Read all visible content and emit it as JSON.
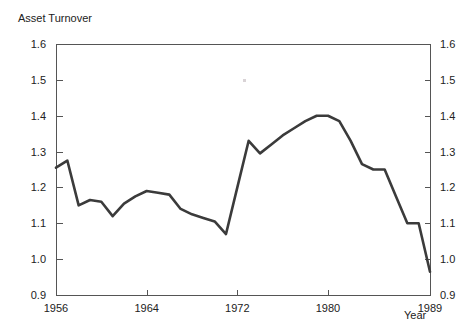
{
  "chart_data": {
    "type": "line",
    "title": "Asset Turnover",
    "xlabel": "Year",
    "ylabel": "",
    "xlim": [
      1956,
      1989
    ],
    "ylim": [
      0.9,
      1.6
    ],
    "grid": false,
    "legend": null,
    "xticks": [
      1956,
      1964,
      1972,
      1980,
      1989
    ],
    "xtick_labels": [
      "1956",
      "1964",
      "1972",
      "1980",
      "1989"
    ],
    "yticks": [
      0.9,
      1.0,
      1.1,
      1.2,
      1.3,
      1.4,
      1.5,
      1.6
    ],
    "ytick_labels": [
      "0.9",
      "1.0",
      "1.1",
      "1.2",
      "1.3",
      "1.4",
      "1.5",
      "1.6"
    ],
    "ytick_labels_right": [
      "0.9",
      "1.0",
      "1.1",
      "1.2",
      "1.3",
      "1.4",
      "1.5",
      "1.6"
    ],
    "line_color": "#3b3b3b",
    "axis_color": "#555555",
    "background_color": "#ffffff",
    "series": [
      {
        "name": "Asset Turnover",
        "x": [
          1956,
          1957,
          1958,
          1959,
          1960,
          1961,
          1962,
          1963,
          1964,
          1965,
          1966,
          1967,
          1968,
          1969,
          1970,
          1971,
          1972,
          1973,
          1974,
          1975,
          1976,
          1977,
          1978,
          1979,
          1980,
          1981,
          1982,
          1983,
          1984,
          1985,
          1986,
          1987,
          1988,
          1989
        ],
        "values": [
          1.255,
          1.275,
          1.15,
          1.165,
          1.16,
          1.12,
          1.155,
          1.175,
          1.19,
          1.185,
          1.18,
          1.14,
          1.125,
          1.115,
          1.105,
          1.07,
          1.2,
          1.33,
          1.295,
          1.32,
          1.345,
          1.365,
          1.385,
          1.4,
          1.4,
          1.385,
          1.33,
          1.265,
          1.25,
          1.25,
          1.175,
          1.1,
          1.1,
          0.965
        ]
      }
    ]
  },
  "axes": {
    "left_axis_name": "y-axis-left",
    "right_axis_name": "y-axis-right",
    "bottom_axis_name": "x-axis"
  }
}
